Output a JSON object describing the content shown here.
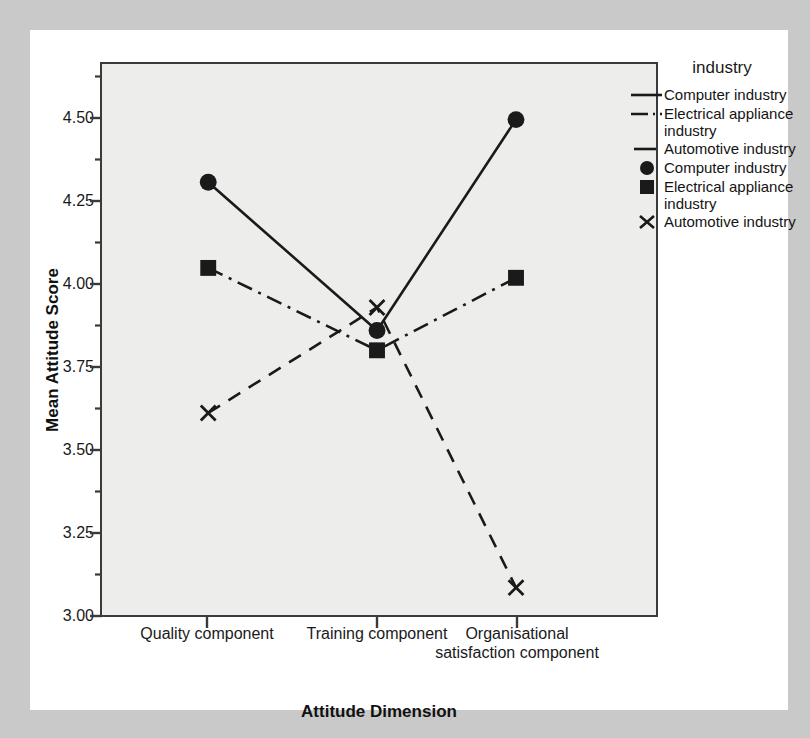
{
  "chart_data": {
    "type": "line",
    "title": "",
    "xlabel": "Attitude Dimension",
    "ylabel": "Mean Attitude Score",
    "legend_title": "industry",
    "legend_position": "right",
    "grid": false,
    "ylim": [
      3.0,
      4.5
    ],
    "ytick_labels": [
      "4.50",
      "4.25",
      "4.00",
      "3.75",
      "3.50",
      "3.25",
      "3.00"
    ],
    "ytick_values": [
      4.5,
      4.25,
      4.0,
      3.75,
      3.5,
      3.25,
      3.0
    ],
    "minor_ticks": true,
    "categories": [
      "Quality component",
      "Training component",
      "Organisational satisfaction component"
    ],
    "series": [
      {
        "name": "Computer industry",
        "marker": "circle",
        "linestyle": "solid",
        "color": "#1a1a1a",
        "values": [
          4.31,
          3.86,
          4.5
        ]
      },
      {
        "name": "Electrical appliance industry",
        "marker": "square",
        "linestyle": "dashdot",
        "color": "#1a1a1a",
        "values": [
          4.05,
          3.8,
          4.02
        ]
      },
      {
        "name": "Automotive industry",
        "marker": "x",
        "linestyle": "dashed",
        "color": "#1a1a1a",
        "values": [
          3.61,
          3.93,
          3.08
        ]
      }
    ]
  },
  "axes": {
    "y_title": "Mean Attitude Score",
    "x_title": "Attitude Dimension",
    "y_ticks": [
      {
        "label": "4.50"
      },
      {
        "label": "4.25"
      },
      {
        "label": "4.00"
      },
      {
        "label": "3.75"
      },
      {
        "label": "3.50"
      },
      {
        "label": "3.25"
      },
      {
        "label": "3.00"
      }
    ],
    "x_ticks": [
      {
        "label": "Quality component"
      },
      {
        "label": "Training component"
      },
      {
        "label": "Organisational satisfaction component"
      }
    ]
  },
  "legend": {
    "title": "industry",
    "entries": [
      {
        "label": "Computer industry",
        "key": "line-solid-icon"
      },
      {
        "label": "Electrical appliance industry",
        "key": "line-dashdot-icon"
      },
      {
        "label": "Automotive industry",
        "key": "line-dashed-icon"
      },
      {
        "label": "Computer industry",
        "key": "marker-circle-icon"
      },
      {
        "label": "Electrical appliance industry",
        "key": "marker-square-icon"
      },
      {
        "label": "Automotive industry",
        "key": "marker-x-icon"
      }
    ]
  },
  "colors": {
    "page_background": "#c9c9c9",
    "card_background": "#ffffff",
    "plot_background": "#ededeb",
    "axis": "#3a3a3a",
    "ink": "#1a1a1a"
  }
}
